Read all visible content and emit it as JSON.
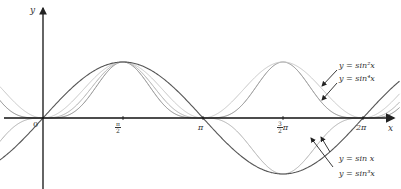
{
  "chart_data": {
    "type": "line",
    "title": "",
    "xlabel": "x",
    "ylabel": "y",
    "origin_label": "0",
    "xlim": [
      -0.6,
      6.8
    ],
    "ylim": [
      -1.15,
      1.35
    ],
    "grid": false,
    "x_ticks": [
      {
        "value": 1.5708,
        "label": "π/2",
        "num": "π",
        "den": "2",
        "suffix": ""
      },
      {
        "value": 3.1416,
        "label": "π",
        "plain": "π"
      },
      {
        "value": 4.7124,
        "label": "3π/2",
        "num": "3",
        "den": "2",
        "suffix": "π"
      },
      {
        "value": 6.2832,
        "label": "2π",
        "plain": "2π"
      }
    ],
    "series": [
      {
        "name": "y = sin x",
        "expr": "sin(x)",
        "power": 1,
        "color": "#555555",
        "width": 1.1
      },
      {
        "name": "y = sin²x",
        "expr": "sin(x)^2",
        "power": 2,
        "color": "#c8c8c8",
        "width": 1.0
      },
      {
        "name": "y = sin³x",
        "expr": "sin(x)^3",
        "power": 3,
        "color": "#b0b0b0",
        "width": 1.0
      },
      {
        "name": "y = sin⁴x",
        "expr": "sin(x)^4",
        "power": 4,
        "color": "#8a8a8a",
        "width": 1.0
      }
    ],
    "annotations": [
      {
        "text": "y = sin²x",
        "position": "upper-right"
      },
      {
        "text": "y = sin⁴x",
        "position": "upper-right"
      },
      {
        "text": "y = sin x",
        "position": "lower-right"
      },
      {
        "text": "y = sin³x",
        "position": "lower-right"
      }
    ],
    "legend": null
  }
}
